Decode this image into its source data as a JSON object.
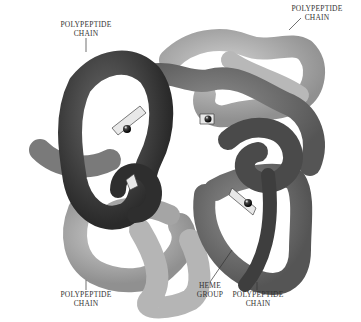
{
  "diagram": {
    "labels": [
      {
        "id": "chain-top-left",
        "line1": "POLYPEPTIDE",
        "line2": "CHAIN"
      },
      {
        "id": "chain-top-right",
        "line1": "POLYPEPTIDE",
        "line2": "CHAIN"
      },
      {
        "id": "chain-bottom-left",
        "line1": "POLYPEPTIDE",
        "line2": "CHAIN"
      },
      {
        "id": "heme-group",
        "line1": "HEME",
        "line2": "GROUP"
      },
      {
        "id": "chain-bottom-right",
        "line1": "POLYPEPTIDE",
        "line2": "CHAIN"
      }
    ],
    "colors": {
      "chain_dark": "#3a3a3a",
      "chain_mid": "#6e6e6e",
      "chain_light": "#a8a8a8",
      "chain_lighter": "#bdbdbd",
      "heme_iron": "#111111",
      "heme_plate": "#e8e8e8"
    }
  }
}
